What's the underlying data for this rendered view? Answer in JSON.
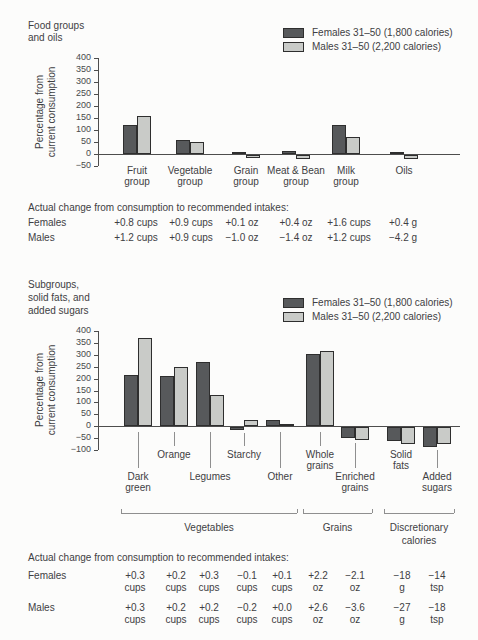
{
  "colors": {
    "females_fill": "#57595b",
    "males_fill": "#c9cbc8",
    "bar_border": "#2e2e2e",
    "axis": "#4d4d4d",
    "leader": "#8f8f8f",
    "text": "#3e4043",
    "background": "#fcfcfb"
  },
  "legend": {
    "females_label": "Females 31–50 (1,800 calories)",
    "males_label": "Males 31–50 (2,200 calories)"
  },
  "chart_data": [
    {
      "type": "bar",
      "title": "Food groups and oils",
      "title_lines": [
        "Food groups",
        "and oils"
      ],
      "ylabel": "Percentage from current consumption",
      "ylabel_lines": [
        "Percentage from",
        "current consumption"
      ],
      "xlabel": "",
      "ylim": [
        -50,
        400
      ],
      "ytick_step": 50,
      "yticks": [
        400,
        350,
        300,
        250,
        200,
        150,
        100,
        50,
        0,
        -50
      ],
      "grid": false,
      "legend_position": "top-right",
      "categories": [
        "Fruit group",
        "Vegetable group",
        "Grain group",
        "Meat & Bean group",
        "Milk group",
        "Oils"
      ],
      "category_label_lines": [
        [
          "Fruit",
          "group"
        ],
        [
          "Vegetable",
          "group"
        ],
        [
          "Grain",
          "group"
        ],
        [
          "Meat & Bean",
          "group"
        ],
        [
          "Milk",
          "group"
        ],
        [
          "Oils"
        ]
      ],
      "series": [
        {
          "name": "Females 31–50 (1,800 calories)",
          "values": [
            120,
            60,
            8,
            12,
            120,
            8
          ]
        },
        {
          "name": "Males 31–50 (2,200 calories)",
          "values": [
            160,
            50,
            -12,
            -18,
            70,
            -15
          ]
        }
      ],
      "table": {
        "header": "Actual change from consumption to recommended intakes:",
        "rows": [
          {
            "label": "Females",
            "values": [
              "+0.8 cups",
              "+0.9 cups",
              "+0.1 oz",
              "+0.4 oz",
              "+1.6 cups",
              "+0.4 g"
            ]
          },
          {
            "label": "Males",
            "values": [
              "+1.2 cups",
              "+0.9 cups",
              "−1.0 oz",
              "−1.4 oz",
              "+1.2 cups",
              "−4.2 g"
            ]
          }
        ]
      }
    },
    {
      "type": "bar",
      "title": "Subgroups, solid fats, and added sugars",
      "title_lines": [
        "Subgroups,",
        "solid fats, and",
        "added sugars"
      ],
      "ylabel": "Percentage from current consumption",
      "ylabel_lines": [
        "Percentage from",
        "current consumption"
      ],
      "xlabel": "",
      "ylim": [
        -100,
        400
      ],
      "ytick_step": 50,
      "yticks": [
        400,
        350,
        300,
        250,
        200,
        150,
        100,
        50,
        0,
        -50,
        -100
      ],
      "grid": false,
      "legend_position": "top-right",
      "categories": [
        "Dark green",
        "Orange",
        "Legumes",
        "Starchy",
        "Other",
        "Whole grains",
        "Enriched grains",
        "Solid fats",
        "Added sugars"
      ],
      "category_label_lines": [
        [
          "Dark",
          "green"
        ],
        [
          "Orange"
        ],
        [
          "Legumes"
        ],
        [
          "Starchy"
        ],
        [
          "Other"
        ],
        [
          "Whole",
          "grains"
        ],
        [
          "Enriched",
          "grains"
        ],
        [
          "Solid",
          "fats"
        ],
        [
          "Added",
          "sugars"
        ]
      ],
      "series": [
        {
          "name": "Females 31–50 (1,800 calories)",
          "values": [
            215,
            210,
            270,
            -10,
            25,
            305,
            -45,
            -60,
            -85
          ]
        },
        {
          "name": "Males 31–50 (2,200 calories)",
          "values": [
            370,
            250,
            130,
            25,
            10,
            315,
            -55,
            -70,
            -70
          ]
        }
      ],
      "groups": [
        {
          "label": "Vegetables",
          "label_lines": [
            "Vegetables"
          ],
          "from": 0,
          "to": 4
        },
        {
          "label": "Grains",
          "label_lines": [
            "Grains"
          ],
          "from": 5,
          "to": 6
        },
        {
          "label": "Discretionary calories",
          "label_lines": [
            "Discretionary",
            "calories"
          ],
          "from": 7,
          "to": 8
        }
      ],
      "table": {
        "header": "Actual change from consumption to recommended intakes:",
        "rows": [
          {
            "label": "Females",
            "values": [
              [
                "+0.3",
                "cups"
              ],
              [
                "+0.2",
                "cups"
              ],
              [
                "+0.3",
                "cups"
              ],
              [
                "−0.1",
                "cups"
              ],
              [
                "+0.1",
                "cups"
              ],
              [
                "+2.2",
                "oz"
              ],
              [
                "−2.1",
                "oz"
              ],
              [
                "−18",
                "g"
              ],
              [
                "−14",
                "tsp"
              ]
            ]
          },
          {
            "label": "Males",
            "values": [
              [
                "+0.3",
                "cups"
              ],
              [
                "+0.2",
                "cups"
              ],
              [
                "+0.2",
                "cups"
              ],
              [
                "−0.2",
                "cups"
              ],
              [
                "+0.0",
                "cups"
              ],
              [
                "+2.6",
                "oz"
              ],
              [
                "−3.6",
                "oz"
              ],
              [
                "−27",
                "g"
              ],
              [
                "−18",
                "tsp"
              ]
            ]
          }
        ]
      }
    }
  ],
  "layout": {
    "chart1": {
      "axis_x": 98,
      "plot_right": 460,
      "y_top": 58,
      "px50": 12,
      "centers": [
        137,
        190,
        246,
        296,
        346,
        404
      ],
      "bar_w": 14,
      "cat_label_y": 165,
      "table": {
        "top": 202,
        "rows_y": [
          217,
          232
        ],
        "cols": [
          136,
          191,
          242,
          296,
          349,
          403
        ],
        "label_x": 28,
        "two_line": false
      }
    },
    "chart2": {
      "axis_x": 98,
      "plot_right": 460,
      "y_top": 331,
      "px50": 11.9,
      "centers": [
        138,
        174,
        210,
        244,
        280,
        320,
        355,
        401,
        437
      ],
      "bar_w": 14,
      "label_rows": [
        2,
        1,
        2,
        1,
        2,
        1,
        2,
        1,
        2
      ],
      "row1_y": 449,
      "row2_y": 471,
      "bracket_y": 513,
      "bracket_label_y": 521,
      "bracket_pad": 17,
      "table": {
        "top": 552,
        "rows_y": [
          570,
          602
        ],
        "cols": [
          135,
          176,
          209,
          247,
          282,
          318,
          355,
          402,
          437
        ],
        "label_x": 28,
        "two_line": true
      }
    }
  }
}
